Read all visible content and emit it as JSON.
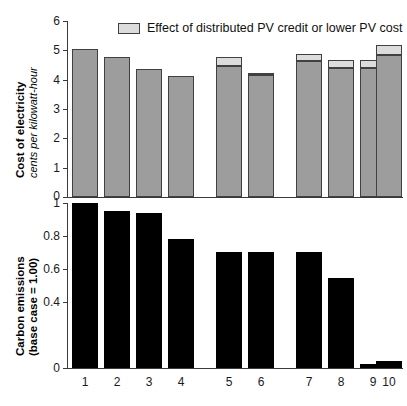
{
  "legend": {
    "label": "Effect of distributed PV credit or lower PV cost",
    "swatch_color": "#dcdcdc",
    "icon": "legend-swatch-icon"
  },
  "caption_cut": "",
  "colors": {
    "bar_cost": "#9d9d9d",
    "bar_cost_credit": "#dcdcdc",
    "bar_carbon": "#000000",
    "axis": "#3a3a3a"
  },
  "chart_data": [
    {
      "type": "bar",
      "id": "cost-of-electricity",
      "title": "",
      "xlabel": "",
      "ylabel": "Cost of electricity",
      "ylabel_sub": "cents per kilowatt-hour",
      "ylim": [
        0,
        6
      ],
      "yticks": [
        0,
        1,
        2,
        3,
        4,
        5,
        6
      ],
      "ytick_labels": [
        "0",
        "1",
        "2",
        "3",
        "4",
        "5",
        "6"
      ],
      "grid": false,
      "legend_position": "top-center",
      "categories": [
        "1",
        "2",
        "3",
        "4",
        "5",
        "6",
        "7",
        "8",
        "9",
        "10"
      ],
      "series": [
        {
          "name": "Cost of electricity",
          "values": [
            5.03,
            4.78,
            4.37,
            4.14,
            4.48,
            4.15,
            4.65,
            4.39,
            4.4,
            4.83
          ]
        },
        {
          "name": "Effect of distributed PV credit or lower PV cost",
          "values": [
            0,
            0,
            0,
            0,
            0.28,
            0.09,
            0.24,
            0.28,
            0.26,
            0.35
          ]
        }
      ],
      "totals": [
        5.03,
        4.78,
        4.37,
        4.14,
        4.76,
        4.24,
        4.89,
        4.67,
        4.66,
        5.18
      ]
    },
    {
      "type": "bar",
      "id": "carbon-emissions",
      "title": "",
      "xlabel": "",
      "ylabel": "Carbon emissions",
      "ylabel_sub": "(base case = 1.00)",
      "ylim": [
        0,
        1
      ],
      "yticks": [
        0,
        0.4,
        0.6,
        0.8,
        1
      ],
      "ytick_labels": [
        "0",
        "0.4",
        "0.6",
        "0.8",
        "1"
      ],
      "grid": false,
      "categories": [
        "1",
        "2",
        "3",
        "4",
        "5",
        "6",
        "7",
        "8",
        "9",
        "10"
      ],
      "values": [
        1.0,
        0.95,
        0.94,
        0.785,
        0.705,
        0.705,
        0.705,
        0.545,
        0.025,
        0.045
      ]
    }
  ]
}
